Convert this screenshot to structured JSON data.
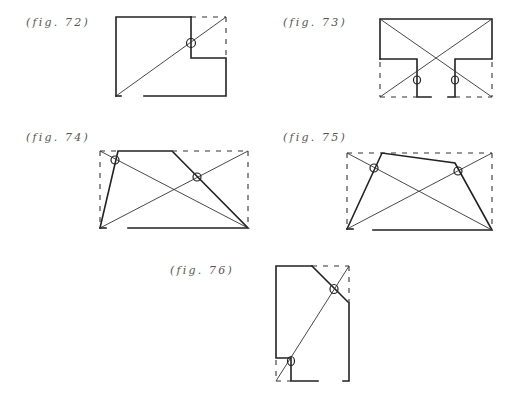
{
  "figures": [
    {
      "id": "fig-72",
      "label": "(fig. 72)"
    },
    {
      "id": "fig-73",
      "label": "(fig. 73)"
    },
    {
      "id": "fig-74",
      "label": "(fig. 74)"
    },
    {
      "id": "fig-75",
      "label": "(fig. 75)"
    },
    {
      "id": "fig-76",
      "label": "(fig. 76)"
    }
  ],
  "colors": {
    "line": "#222222",
    "label": "#555555",
    "background": "#ffffff"
  }
}
